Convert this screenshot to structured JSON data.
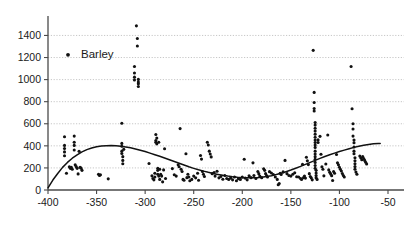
{
  "chart_data": {
    "type": "scatter",
    "title": "",
    "xlabel": "",
    "ylabel": "",
    "xlim": [
      -400,
      -50
    ],
    "ylim": [
      0,
      1500
    ],
    "grid": true,
    "legend_position": "upper-left-inside",
    "xticks": [
      -400,
      -350,
      -300,
      -250,
      -200,
      -150,
      -100,
      -50
    ],
    "xtick_labels": [
      "-400",
      "-350",
      "-300",
      "-250",
      "-200",
      "-150",
      "-100",
      "-50"
    ],
    "yticks": [
      0,
      200,
      400,
      600,
      800,
      1000,
      1200,
      1400
    ],
    "ytick_labels": [
      "0",
      "200",
      "400",
      "600",
      "800",
      "1000",
      "1200",
      "1400"
    ],
    "series": [
      {
        "name": "Barley",
        "marker": "circle",
        "color": "#111111",
        "points": [
          [
            -383,
            482
          ],
          [
            -383,
            404
          ],
          [
            -383,
            376
          ],
          [
            -383,
            345
          ],
          [
            -383,
            310
          ],
          [
            -381,
            152
          ],
          [
            -378,
            210
          ],
          [
            -377,
            196
          ],
          [
            -376,
            205
          ],
          [
            -375,
            188
          ],
          [
            -373,
            488
          ],
          [
            -373,
            432
          ],
          [
            -373,
            404
          ],
          [
            -373,
            362
          ],
          [
            -372,
            228
          ],
          [
            -371,
            212
          ],
          [
            -370,
            196
          ],
          [
            -369,
            146
          ],
          [
            -368,
            350
          ],
          [
            -367,
            206
          ],
          [
            -366,
            198
          ],
          [
            -365,
            178
          ],
          [
            -348,
            142
          ],
          [
            -347,
            132
          ],
          [
            -346,
            138
          ],
          [
            -338,
            101
          ],
          [
            -324,
            605
          ],
          [
            -324,
            422
          ],
          [
            -324,
            396
          ],
          [
            -324,
            352
          ],
          [
            -324,
            330
          ],
          [
            -323,
            302
          ],
          [
            -323,
            268
          ],
          [
            -323,
            238
          ],
          [
            -322,
            368
          ],
          [
            -311,
            1118
          ],
          [
            -311,
            1060
          ],
          [
            -311,
            1022
          ],
          [
            -311,
            996
          ],
          [
            -309,
            1487
          ],
          [
            -308,
            1372
          ],
          [
            -308,
            1305
          ],
          [
            -307,
            1002
          ],
          [
            -307,
            978
          ],
          [
            -307,
            962
          ],
          [
            -307,
            938
          ],
          [
            -296,
            240
          ],
          [
            -293,
            128
          ],
          [
            -292,
            104
          ],
          [
            -291,
            92
          ],
          [
            -290,
            152
          ],
          [
            -290,
            118
          ],
          [
            -289,
            503
          ],
          [
            -289,
            448
          ],
          [
            -289,
            432
          ],
          [
            -288,
            470
          ],
          [
            -288,
            418
          ],
          [
            -287,
            196
          ],
          [
            -287,
            178
          ],
          [
            -287,
            142
          ],
          [
            -286,
            432
          ],
          [
            -286,
            126
          ],
          [
            -285,
            188
          ],
          [
            -285,
            96
          ],
          [
            -284,
            142
          ],
          [
            -283,
            126
          ],
          [
            -282,
            74
          ],
          [
            -281,
            182
          ],
          [
            -280,
            374
          ],
          [
            -279,
            104
          ],
          [
            -272,
            194
          ],
          [
            -270,
            138
          ],
          [
            -268,
            126
          ],
          [
            -266,
            228
          ],
          [
            -265,
            210
          ],
          [
            -264,
            556
          ],
          [
            -263,
            188
          ],
          [
            -262,
            168
          ],
          [
            -261,
            96
          ],
          [
            -260,
            88
          ],
          [
            -258,
            328
          ],
          [
            -257,
            112
          ],
          [
            -256,
            142
          ],
          [
            -255,
            118
          ],
          [
            -254,
            84
          ],
          [
            -252,
            96
          ],
          [
            -250,
            126
          ],
          [
            -248,
            110
          ],
          [
            -246,
            152
          ],
          [
            -245,
            88
          ],
          [
            -243,
            312
          ],
          [
            -242,
            280
          ],
          [
            -241,
            168
          ],
          [
            -240,
            142
          ],
          [
            -239,
            122
          ],
          [
            -236,
            432
          ],
          [
            -235,
            408
          ],
          [
            -234,
            352
          ],
          [
            -233,
            326
          ],
          [
            -232,
            300
          ],
          [
            -231,
            148
          ],
          [
            -229,
            158
          ],
          [
            -228,
            126
          ],
          [
            -226,
            170
          ],
          [
            -224,
            110
          ],
          [
            -222,
            122
          ],
          [
            -220,
            98
          ],
          [
            -218,
            132
          ],
          [
            -216,
            104
          ],
          [
            -214,
            96
          ],
          [
            -212,
            108
          ],
          [
            -210,
            92
          ],
          [
            -208,
            118
          ],
          [
            -206,
            84
          ],
          [
            -204,
            102
          ],
          [
            -202,
            96
          ],
          [
            -200,
            118
          ],
          [
            -198,
            278
          ],
          [
            -197,
            108
          ],
          [
            -195,
            92
          ],
          [
            -193,
            128
          ],
          [
            -191,
            112
          ],
          [
            -189,
            246
          ],
          [
            -188,
            132
          ],
          [
            -186,
            104
          ],
          [
            -184,
            168
          ],
          [
            -183,
            148
          ],
          [
            -182,
            126
          ],
          [
            -180,
            112
          ],
          [
            -178,
            192
          ],
          [
            -177,
            178
          ],
          [
            -176,
            148
          ],
          [
            -175,
            130
          ],
          [
            -174,
            118
          ],
          [
            -172,
            166
          ],
          [
            -170,
            154
          ],
          [
            -168,
            140
          ],
          [
            -166,
            118
          ],
          [
            -164,
            96
          ],
          [
            -163,
            48
          ],
          [
            -162,
            58
          ],
          [
            -161,
            152
          ],
          [
            -160,
            140
          ],
          [
            -158,
            164
          ],
          [
            -156,
            268
          ],
          [
            -154,
            148
          ],
          [
            -152,
            132
          ],
          [
            -150,
            126
          ],
          [
            -148,
            142
          ],
          [
            -146,
            156
          ],
          [
            -144,
            120
          ],
          [
            -142,
            118
          ],
          [
            -140,
            104
          ],
          [
            -139,
            96
          ],
          [
            -138,
            232
          ],
          [
            -137,
            112
          ],
          [
            -136,
            126
          ],
          [
            -135,
            108
          ],
          [
            -134,
            296
          ],
          [
            -133,
            264
          ],
          [
            -132,
            230
          ],
          [
            -131,
            148
          ],
          [
            -130,
            122
          ],
          [
            -129,
            110
          ],
          [
            -128,
            92
          ],
          [
            -127,
            1265
          ],
          [
            -126,
            884
          ],
          [
            -126,
            792
          ],
          [
            -126,
            738
          ],
          [
            -126,
            716
          ],
          [
            -125,
            612
          ],
          [
            -125,
            588
          ],
          [
            -125,
            560
          ],
          [
            -125,
            534
          ],
          [
            -125,
            506
          ],
          [
            -125,
            478
          ],
          [
            -125,
            452
          ],
          [
            -125,
            430
          ],
          [
            -125,
            408
          ],
          [
            -125,
            386
          ],
          [
            -125,
            352
          ],
          [
            -125,
            326
          ],
          [
            -125,
            302
          ],
          [
            -125,
            278
          ],
          [
            -125,
            250
          ],
          [
            -125,
            222
          ],
          [
            -125,
            196
          ],
          [
            -124,
            178
          ],
          [
            -124,
            154
          ],
          [
            -124,
            132
          ],
          [
            -124,
            112
          ],
          [
            -123,
            96
          ],
          [
            -122,
            454
          ],
          [
            -122,
            430
          ],
          [
            -120,
            486
          ],
          [
            -119,
            324
          ],
          [
            -118,
            210
          ],
          [
            -117,
            188
          ],
          [
            -116,
            128
          ],
          [
            -114,
            236
          ],
          [
            -112,
            498
          ],
          [
            -111,
            182
          ],
          [
            -110,
            160
          ],
          [
            -109,
            146
          ],
          [
            -108,
            130
          ],
          [
            -107,
            86
          ],
          [
            -106,
            168
          ],
          [
            -105,
            152
          ],
          [
            -103,
            322
          ],
          [
            -102,
            246
          ],
          [
            -101,
            228
          ],
          [
            -100,
            206
          ],
          [
            -99,
            188
          ],
          [
            -98,
            172
          ],
          [
            -97,
            150
          ],
          [
            -96,
            132
          ],
          [
            -95,
            118
          ],
          [
            -88,
            1118
          ],
          [
            -87,
            736
          ],
          [
            -86,
            600
          ],
          [
            -86,
            552
          ],
          [
            -86,
            488
          ],
          [
            -85,
            452
          ],
          [
            -85,
            428
          ],
          [
            -85,
            390
          ],
          [
            -85,
            352
          ],
          [
            -85,
            328
          ],
          [
            -84,
            292
          ],
          [
            -84,
            264
          ],
          [
            -84,
            238
          ],
          [
            -84,
            212
          ],
          [
            -84,
            188
          ],
          [
            -83,
            162
          ],
          [
            -82,
            142
          ],
          [
            -79,
            308
          ],
          [
            -78,
            292
          ],
          [
            -77,
            274
          ],
          [
            -76,
            302
          ],
          [
            -75,
            286
          ],
          [
            -74,
            268
          ],
          [
            -73,
            252
          ],
          [
            -72,
            236
          ]
        ]
      }
    ],
    "trend_curve": {
      "name": "fitted-polynomial-trend",
      "color": "#111111",
      "points": [
        [
          -400,
          20
        ],
        [
          -395,
          90
        ],
        [
          -390,
          150
        ],
        [
          -385,
          205
        ],
        [
          -380,
          250
        ],
        [
          -375,
          288
        ],
        [
          -370,
          318
        ],
        [
          -365,
          345
        ],
        [
          -360,
          366
        ],
        [
          -355,
          381
        ],
        [
          -350,
          392
        ],
        [
          -345,
          398
        ],
        [
          -340,
          401
        ],
        [
          -335,
          402
        ],
        [
          -330,
          400
        ],
        [
          -325,
          396
        ],
        [
          -320,
          390
        ],
        [
          -315,
          382
        ],
        [
          -310,
          372
        ],
        [
          -305,
          360
        ],
        [
          -300,
          348
        ],
        [
          -295,
          334
        ],
        [
          -290,
          320
        ],
        [
          -285,
          305
        ],
        [
          -280,
          290
        ],
        [
          -275,
          274
        ],
        [
          -270,
          258
        ],
        [
          -265,
          242
        ],
        [
          -260,
          226
        ],
        [
          -255,
          210
        ],
        [
          -250,
          196
        ],
        [
          -245,
          183
        ],
        [
          -240,
          171
        ],
        [
          -235,
          160
        ],
        [
          -230,
          150
        ],
        [
          -225,
          141
        ],
        [
          -220,
          133
        ],
        [
          -215,
          126
        ],
        [
          -210,
          120
        ],
        [
          -205,
          115
        ],
        [
          -200,
          112
        ],
        [
          -195,
          110
        ],
        [
          -190,
          110
        ],
        [
          -185,
          112
        ],
        [
          -180,
          116
        ],
        [
          -175,
          122
        ],
        [
          -170,
          130
        ],
        [
          -165,
          140
        ],
        [
          -160,
          152
        ],
        [
          -155,
          166
        ],
        [
          -150,
          181
        ],
        [
          -145,
          197
        ],
        [
          -140,
          214
        ],
        [
          -135,
          232
        ],
        [
          -130,
          250
        ],
        [
          -125,
          268
        ],
        [
          -120,
          286
        ],
        [
          -115,
          303
        ],
        [
          -110,
          319
        ],
        [
          -105,
          334
        ],
        [
          -100,
          348
        ],
        [
          -95,
          361
        ],
        [
          -90,
          374
        ],
        [
          -85,
          386
        ],
        [
          -80,
          396
        ],
        [
          -75,
          405
        ],
        [
          -70,
          412
        ],
        [
          -65,
          418
        ],
        [
          -60,
          421
        ],
        [
          -58,
          422
        ]
      ]
    },
    "legend": [
      {
        "label": "Barley",
        "marker": "circle",
        "color": "#111111"
      }
    ]
  }
}
